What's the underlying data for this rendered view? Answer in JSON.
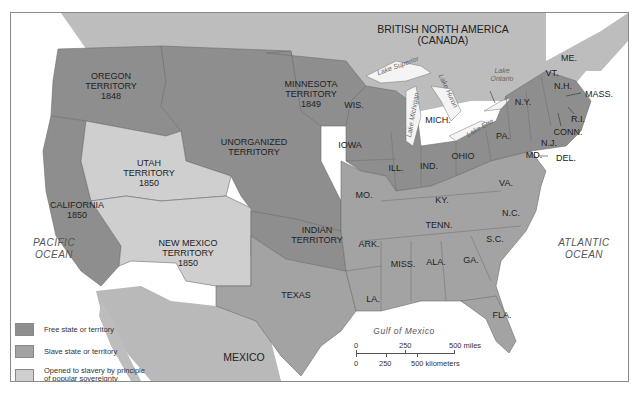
{
  "map": {
    "colors": {
      "free": "#8e8e8e",
      "slave": "#a3a3a3",
      "popular_sovereignty": "#cfcfcf",
      "foreign": "#b9b9b9",
      "water": "#ffffff",
      "border": "#6d6d6d"
    },
    "regions": {
      "british_north_america": "BRITISH NORTH AMERICA\n(CANADA)",
      "oregon": [
        "OREGON",
        "TERRITORY",
        "1848"
      ],
      "minnesota": [
        "MINNESOTA",
        "TERRITORY",
        "1849"
      ],
      "unorganized": [
        "UNORGANIZED",
        "TERRITORY"
      ],
      "utah": [
        "UTAH",
        "TERRITORY",
        "1850"
      ],
      "california": [
        "CALIFORNIA",
        "1850"
      ],
      "new_mexico": [
        "NEW MEXICO",
        "TERRITORY",
        "1850"
      ],
      "indian": [
        "INDIAN",
        "TERRITORY"
      ],
      "texas": "TEXAS",
      "mexico": "MEXICO",
      "states": {
        "wis": "WIS.",
        "iowa": "IOWA",
        "mich": "MICH.",
        "ill": "ILL.",
        "ind": "IND.",
        "ohio": "OHIO",
        "mo": "MO.",
        "ky": "KY.",
        "va": "VA.",
        "tenn": "TENN.",
        "nc": "N.C.",
        "sc": "S.C.",
        "ga": "GA.",
        "ala": "ALA.",
        "miss": "MISS.",
        "ark": "ARK.",
        "la": "LA.",
        "fla": "FLA.",
        "pa": "PA.",
        "ny": "N.Y.",
        "vt": "VT.",
        "nh": "N.H.",
        "me": "ME.",
        "mass": "MASS.",
        "ri": "R.I.",
        "conn": "CONN.",
        "nj": "N.J.",
        "md": "MD.",
        "del": "DEL."
      }
    },
    "water_labels": {
      "pacific": [
        "PACIFIC",
        "OCEAN"
      ],
      "atlantic": [
        "ATLANTIC",
        "OCEAN"
      ],
      "gulf": "Gulf of Mexico",
      "lake_superior": "Lake Superior",
      "lake_michigan": "Lake Michigan",
      "lake_huron": "Lake Huron",
      "lake_erie": "Lake Erie",
      "lake_ontario": [
        "Lake",
        "Ontario"
      ]
    },
    "legend": [
      {
        "label": "Free state or territory",
        "key": "free"
      },
      {
        "label": "Slave state or territory",
        "key": "slave"
      },
      {
        "label": "Opened to slavery by principle of popular sovereignty",
        "label_lines": [
          "Opened to slavery by principle",
          "of popular sovereignty"
        ],
        "key": "popular_sovereignty"
      }
    ],
    "scale": {
      "miles": [
        "0",
        "250",
        "500 miles"
      ],
      "kilometers": [
        "0",
        "250",
        "500 kilometers"
      ]
    }
  }
}
